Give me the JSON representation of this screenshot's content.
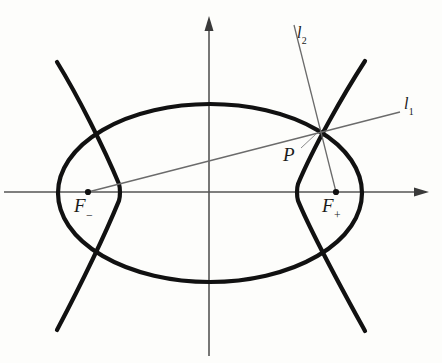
{
  "figure": {
    "background_color": "#fdfdfb",
    "curve_color": "#111111",
    "axis_color": "#555555",
    "line_color": "#6b6b6b",
    "label_color": "#1a1a1a"
  },
  "axes": {
    "x_axis": {
      "name": "horizontal-axis",
      "y": 192,
      "x_start": 4,
      "x_end": 430,
      "arrow": "right"
    },
    "y_axis": {
      "name": "vertical-axis",
      "x": 209,
      "y_start": 356,
      "y_end": 16,
      "arrow": "up"
    }
  },
  "curves": {
    "ellipse": {
      "name": "ellipse",
      "center_x": 210,
      "center_y": 193,
      "semi_major_x": 152,
      "semi_minor_y": 89
    },
    "hyperbola": {
      "name": "hyperbola",
      "center_x": 210,
      "center_y": 192,
      "a": 89,
      "b": 104,
      "left_vertex_x": 120,
      "right_vertex_x": 297
    }
  },
  "points": [
    {
      "key": "focus_negative",
      "label": "F",
      "subscript": "−",
      "x": 88,
      "y": 192
    },
    {
      "key": "focus_positive",
      "label": "F",
      "subscript": "+",
      "x": 336,
      "y": 192
    },
    {
      "key": "intersection",
      "label": "P",
      "subscript": "",
      "x": 318,
      "y": 132
    }
  ],
  "lines": [
    {
      "key": "l1",
      "label": "l",
      "subscript": "1",
      "description": "focal chord through F minus and P",
      "x1": 88,
      "y1": 192,
      "x2": 400,
      "y2": 112
    },
    {
      "key": "l2",
      "label": "l",
      "subscript": "2",
      "description": "focal ray through F plus and P",
      "x1": 336,
      "y1": 192,
      "x2": 294,
      "y2": 25
    },
    {
      "key": "p_leader",
      "label": "",
      "subscript": "",
      "description": "leader line from P label to intersection point",
      "x1": 300,
      "y1": 147,
      "x2": 316,
      "y2": 134
    }
  ],
  "labels": {
    "focus_negative": {
      "text": "F",
      "sub": "−"
    },
    "focus_positive": {
      "text": "F",
      "sub": "+"
    },
    "point_p": {
      "text": "P",
      "sub": ""
    },
    "line_1": {
      "text": "l",
      "sub": "1"
    },
    "line_2": {
      "text": "l",
      "sub": "2"
    }
  },
  "artifacts": {
    "ghost_a": "",
    "ghost_b": ""
  }
}
